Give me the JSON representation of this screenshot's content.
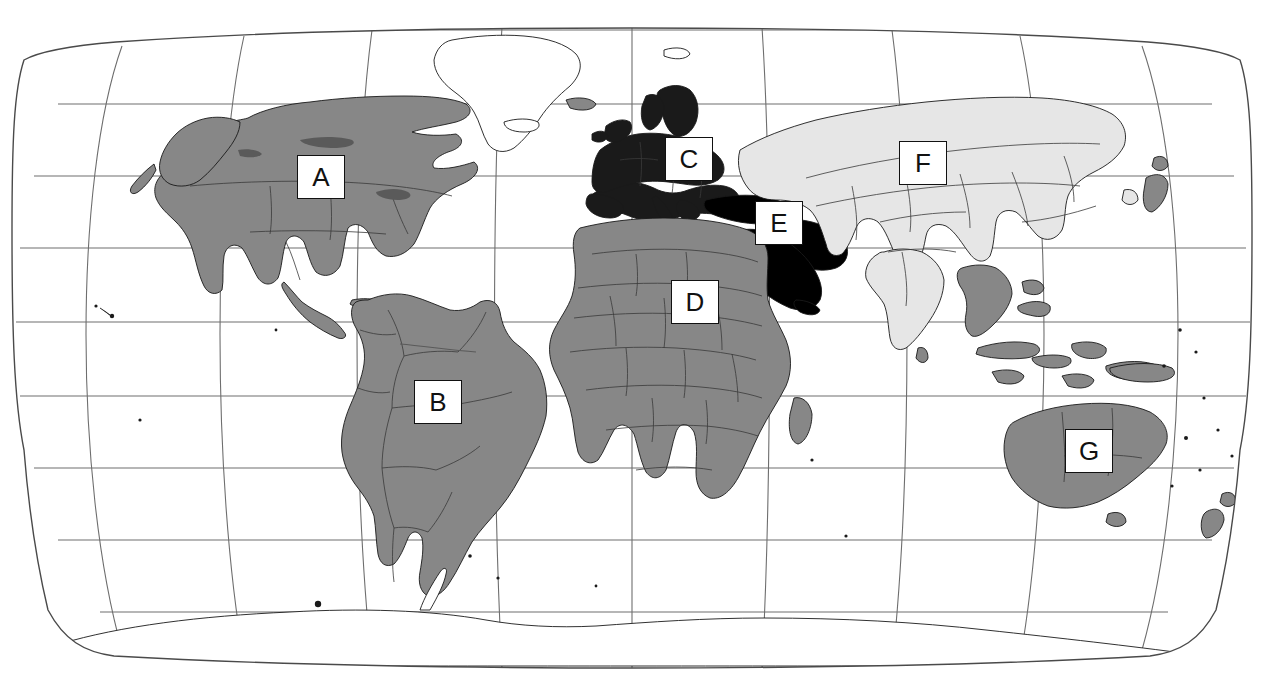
{
  "figure": {
    "projection": "Robinson",
    "background_color": "#ffffff",
    "caption": ""
  },
  "palette": {
    "region_medium_gray": "#878787",
    "region_dark": "#1a1a1a",
    "region_black": "#000000",
    "region_light_gray": "#e6e6e6",
    "region_unfilled": "#ffffff",
    "outline": "#1a1a1a",
    "graticule": "#6e6e6e",
    "frame": "#4a4a4a",
    "label_text": "#111111",
    "label_border": "#111111",
    "label_fill": "#ffffff"
  },
  "legend_labels": [
    {
      "id": "A",
      "label": "A",
      "region": "North America",
      "shade": "medium-gray",
      "x": 297,
      "y": 155,
      "w": 48,
      "h": 44
    },
    {
      "id": "B",
      "label": "B",
      "region": "South America",
      "shade": "medium-gray",
      "x": 414,
      "y": 380,
      "w": 48,
      "h": 44
    },
    {
      "id": "C",
      "label": "C",
      "region": "Europe",
      "shade": "dark",
      "x": 665,
      "y": 137,
      "w": 48,
      "h": 44
    },
    {
      "id": "D",
      "label": "D",
      "region": "Africa",
      "shade": "medium-gray",
      "x": 671,
      "y": 280,
      "w": 48,
      "h": 44
    },
    {
      "id": "E",
      "label": "E",
      "region": "Middle East",
      "shade": "black",
      "x": 755,
      "y": 201,
      "w": 48,
      "h": 44
    },
    {
      "id": "F",
      "label": "F",
      "region": "Asia",
      "shade": "light-gray",
      "x": 899,
      "y": 141,
      "w": 48,
      "h": 44
    },
    {
      "id": "G",
      "label": "G",
      "region": "Australia",
      "shade": "medium-gray",
      "x": 1065,
      "y": 429,
      "w": 48,
      "h": 44
    }
  ],
  "graticule": {
    "parallels_count": 9,
    "meridians_count": 9,
    "parallel_spacing_degrees": 20,
    "meridian_spacing_degrees": 40,
    "visible": true
  },
  "regions": [
    {
      "name": "North America",
      "letter": "A",
      "shade": "medium-gray",
      "color": "#878787"
    },
    {
      "name": "South America",
      "letter": "B",
      "shade": "medium-gray",
      "color": "#878787"
    },
    {
      "name": "Europe",
      "letter": "C",
      "shade": "dark",
      "color": "#1a1a1a"
    },
    {
      "name": "Africa",
      "letter": "D",
      "shade": "medium-gray",
      "color": "#878787"
    },
    {
      "name": "Middle East",
      "letter": "E",
      "shade": "black",
      "color": "#000000"
    },
    {
      "name": "Asia",
      "letter": "F",
      "shade": "light-gray",
      "color": "#e6e6e6"
    },
    {
      "name": "Australia",
      "letter": "G",
      "shade": "medium-gray",
      "color": "#878787"
    },
    {
      "name": "Greenland",
      "letter": "",
      "shade": "unfilled",
      "color": "#ffffff"
    },
    {
      "name": "Antarctica",
      "letter": "",
      "shade": "unfilled",
      "color": "#ffffff"
    }
  ]
}
